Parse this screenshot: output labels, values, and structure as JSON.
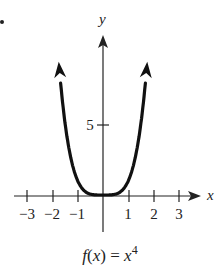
{
  "chart_data": {
    "type": "line",
    "title": "",
    "caption": "f(x) = x^4",
    "caption_parts": {
      "func": "f",
      "lparen": "(",
      "var": "x",
      "rparen": ")",
      "eq": " = ",
      "base": "x",
      "exp": "4"
    },
    "xlabel": "x",
    "ylabel": "y",
    "xlim": [
      -3.3,
      3.8
    ],
    "ylim": [
      -1.5,
      11.5
    ],
    "x_ticks": [
      -3,
      -2,
      -1,
      1,
      2,
      3
    ],
    "x_tick_labels": [
      "−3",
      "−2",
      "−1",
      "1",
      "2",
      "3"
    ],
    "y_ticks": [
      5
    ],
    "y_tick_labels": [
      "5"
    ],
    "grid": false,
    "series": [
      {
        "name": "f(x) = x^4",
        "x": [
          -1.75,
          -1.5,
          -1.25,
          -1,
          -0.75,
          -0.5,
          -0.25,
          0,
          0.25,
          0.5,
          0.75,
          1,
          1.25,
          1.5,
          1.75
        ],
        "values": [
          9.38,
          5.06,
          2.44,
          1,
          0.32,
          0.06,
          0.004,
          0,
          0.004,
          0.06,
          0.32,
          1,
          2.44,
          5.06,
          9.38
        ],
        "arrows_at_ends": true
      }
    ]
  },
  "marker_dot": "•"
}
